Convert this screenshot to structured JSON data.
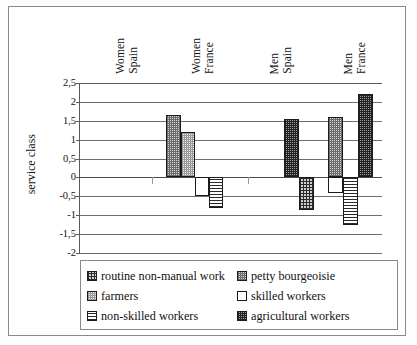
{
  "chart_data": {
    "type": "bar",
    "title": "",
    "xlabel": "",
    "ylabel": "service class",
    "categories": [
      "Women Spain",
      "Women France",
      "Men Spain",
      "Men France"
    ],
    "category_lines": [
      [
        "Women",
        "Spain"
      ],
      [
        "Women",
        "France"
      ],
      [
        "Men",
        "Spain"
      ],
      [
        "Men",
        "France"
      ]
    ],
    "ylim": [
      -2,
      2.5
    ],
    "ytick_labels": [
      "2,5",
      "2",
      "1,5",
      "1",
      "0,5",
      "0",
      "-0,5",
      "-1",
      "-1,5",
      "-2"
    ],
    "ytick_values": [
      2.5,
      2,
      1.5,
      1,
      0.5,
      0,
      -0.5,
      -1,
      -1.5,
      -2
    ],
    "grid": true,
    "legend_position": "bottom",
    "series": [
      {
        "name": "routine non-manual work",
        "pattern": "grid",
        "values": [
          null,
          null,
          null,
          null
        ]
      },
      {
        "name": "petty bourgeoisie",
        "pattern": "checker-mid",
        "values": [
          null,
          1.65,
          null,
          1.6
        ]
      },
      {
        "name": "farmers",
        "pattern": "dots-light",
        "values": [
          null,
          1.2,
          null,
          null
        ]
      },
      {
        "name": "skilled workers",
        "pattern": "white",
        "values": [
          null,
          -0.48,
          null,
          -0.42
        ]
      },
      {
        "name": "non-skilled workers",
        "pattern": "hlines",
        "values": [
          null,
          -0.82,
          -0.85,
          -1.27
        ]
      },
      {
        "name": "agricultural workers",
        "pattern": "checker-dark",
        "values": [
          null,
          null,
          1.55,
          2.2
        ]
      }
    ],
    "bars": [
      {
        "group": "Women France",
        "series": "petty bourgeoisie",
        "value": 1.65,
        "pattern": "checker-mid",
        "x": 86,
        "w": 15
      },
      {
        "group": "Women France",
        "series": "farmers",
        "value": 1.2,
        "pattern": "dots-light",
        "x": 101,
        "w": 14
      },
      {
        "group": "Women France",
        "series": "skilled workers",
        "value": -0.48,
        "pattern": "white",
        "x": 115,
        "w": 14
      },
      {
        "group": "Women France",
        "series": "non-skilled workers",
        "value": -0.82,
        "pattern": "hlines",
        "x": 129,
        "w": 14
      },
      {
        "group": "Men Spain",
        "series": "agricultural workers",
        "value": 1.55,
        "pattern": "checker-dark",
        "x": 204,
        "w": 15
      },
      {
        "group": "Men Spain",
        "series": "non-skilled workers",
        "value": -0.85,
        "pattern": "grid",
        "x": 219,
        "w": 15
      },
      {
        "group": "Men France",
        "series": "petty bourgeoisie",
        "value": 1.6,
        "pattern": "checker-mid",
        "x": 248,
        "w": 15
      },
      {
        "group": "Men France",
        "series": "skilled workers",
        "value": -0.42,
        "pattern": "white",
        "x": 248,
        "w": 15
      },
      {
        "group": "Men France",
        "series": "non-skilled workers",
        "value": -1.27,
        "pattern": "hlines",
        "x": 263,
        "w": 15
      },
      {
        "group": "Men France",
        "series": "agricultural workers",
        "value": 2.2,
        "pattern": "checker-dark",
        "x": 278,
        "w": 15
      }
    ],
    "legend_entries": [
      {
        "label": "routine non-manual work",
        "pattern": "grid"
      },
      {
        "label": "petty bourgeoisie",
        "pattern": "checker-mid"
      },
      {
        "label": "farmers",
        "pattern": "dots-light"
      },
      {
        "label": "skilled workers",
        "pattern": "white"
      },
      {
        "label": "non-skilled workers",
        "pattern": "hlines"
      },
      {
        "label": "agricultural workers",
        "pattern": "checker-dark"
      }
    ]
  },
  "colors": {
    "frame": "#8a8a8a",
    "axis": "#5a5a5a",
    "grid": "#6e6e6e",
    "bar_outline": "#1b1b1b",
    "background": "#ffffff"
  }
}
